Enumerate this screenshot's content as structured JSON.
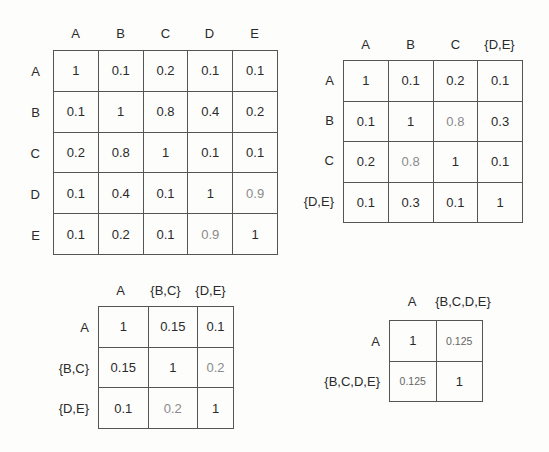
{
  "matrices": [
    {
      "id": "m1",
      "cols": [
        "A",
        "B",
        "C",
        "D",
        "E"
      ],
      "rows": [
        "A",
        "B",
        "C",
        "D",
        "E"
      ],
      "cells": [
        [
          "1",
          "0.1",
          "0.2",
          "0.1",
          "0.1"
        ],
        [
          "0.1",
          "1",
          "0.8",
          "0.4",
          "0.2"
        ],
        [
          "0.2",
          "0.8",
          "1",
          "0.1",
          "0.1"
        ],
        [
          "0.1",
          "0.4",
          "0.1",
          "1",
          "0.9"
        ],
        [
          "0.1",
          "0.2",
          "0.1",
          "0.9",
          "1"
        ]
      ],
      "highlighted": [
        [
          3,
          4
        ],
        [
          4,
          3
        ]
      ]
    },
    {
      "id": "m2",
      "cols": [
        "A",
        "B",
        "C",
        "{D,E}"
      ],
      "rows": [
        "A",
        "B",
        "C",
        "{D,E}"
      ],
      "cells": [
        [
          "1",
          "0.1",
          "0.2",
          "0.1"
        ],
        [
          "0.1",
          "1",
          "0.8",
          "0.3"
        ],
        [
          "0.2",
          "0.8",
          "1",
          "0.1"
        ],
        [
          "0.1",
          "0.3",
          "0.1",
          "1"
        ]
      ],
      "highlighted": [
        [
          1,
          2
        ],
        [
          2,
          1
        ]
      ]
    },
    {
      "id": "m3",
      "cols": [
        "A",
        "{B,C}",
        "{D,E}"
      ],
      "rows": [
        "A",
        "{B,C}",
        "{D,E}"
      ],
      "cells": [
        [
          "1",
          "0.15",
          "0.1"
        ],
        [
          "0.15",
          "1",
          "0.2"
        ],
        [
          "0.1",
          "0.2",
          "1"
        ]
      ],
      "highlighted": [
        [
          1,
          2
        ],
        [
          2,
          1
        ]
      ]
    },
    {
      "id": "m4",
      "cols": [
        "A",
        "{B,C,D,E}"
      ],
      "rows": [
        "A",
        "{B,C,D,E}"
      ],
      "cells": [
        [
          "1",
          "0.125"
        ],
        [
          "0.125",
          "1"
        ]
      ],
      "highlighted": [
        [
          0,
          1
        ],
        [
          1,
          0
        ]
      ]
    }
  ],
  "colors": {
    "border": "#555555",
    "text": "#2a2a2a",
    "faded_text": "#8a8a8a"
  }
}
